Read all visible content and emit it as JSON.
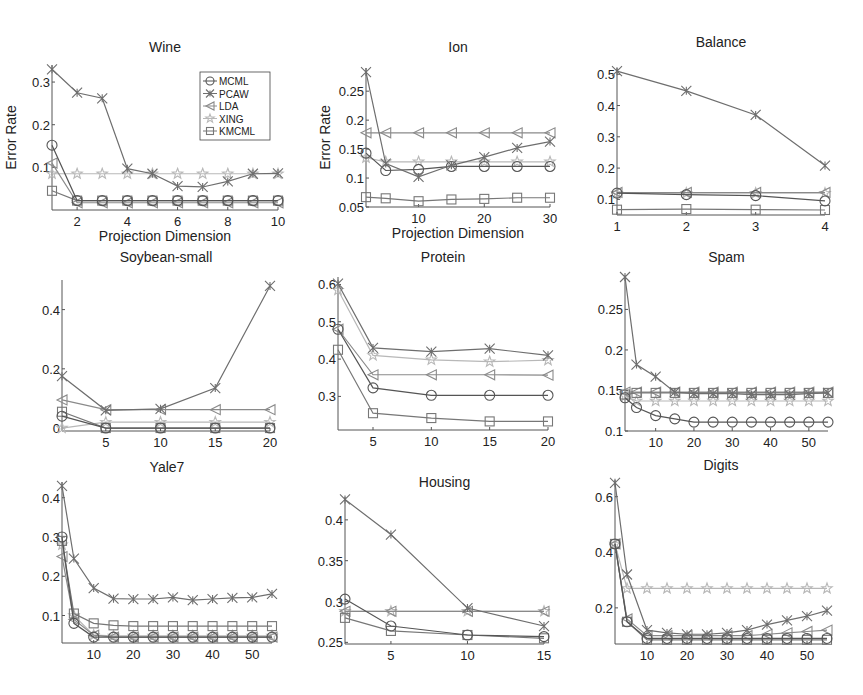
{
  "figure": {
    "legend": {
      "entries": [
        "MCML",
        "PCAW",
        "LDA",
        "XING",
        "KMCML"
      ]
    },
    "series_styles": {
      "MCML": {
        "color": "#555555",
        "marker": "circle"
      },
      "PCAW": {
        "color": "#6e6e6e",
        "marker": "x"
      },
      "LDA": {
        "color": "#8a8a8a",
        "marker": "triangle-left"
      },
      "XING": {
        "color": "#b8b8b8",
        "marker": "star"
      },
      "KMCML": {
        "color": "#777777",
        "marker": "square"
      }
    }
  },
  "chart_data": [
    {
      "type": "line",
      "title": "Wine",
      "xlabel": "Projection Dimension",
      "ylabel": "Error Rate",
      "xlim": [
        1,
        10
      ],
      "ylim": [
        0,
        0.34
      ],
      "xticks": [
        2,
        4,
        6,
        8,
        10
      ],
      "yticks": [
        0.1,
        0.2,
        0.3
      ],
      "ytick_labels": [
        "0.1",
        "0.2",
        "0.3"
      ],
      "legend_position": "upper right",
      "x": [
        1,
        2,
        3,
        4,
        5,
        6,
        7,
        8,
        9,
        10
      ],
      "series": [
        {
          "name": "MCML",
          "values": [
            0.152,
            0.022,
            0.022,
            0.022,
            0.022,
            0.022,
            0.022,
            0.022,
            0.022,
            0.022
          ]
        },
        {
          "name": "PCAW",
          "values": [
            0.33,
            0.275,
            0.262,
            0.097,
            0.085,
            0.056,
            0.054,
            0.067,
            0.085,
            0.086
          ]
        },
        {
          "name": "LDA",
          "values": [
            0.11,
            0.017,
            0.017,
            0.017,
            0.017,
            0.017,
            0.017,
            0.017,
            0.017,
            0.017
          ]
        },
        {
          "name": "XING",
          "values": [
            0.085,
            0.085,
            0.085,
            0.085,
            0.085,
            0.085,
            0.085,
            0.085,
            0.085,
            0.085
          ]
        },
        {
          "name": "KMCML",
          "values": [
            0.045,
            0.022,
            0.022,
            0.022,
            0.022,
            0.022,
            0.022,
            0.022,
            0.022,
            0.022
          ]
        }
      ]
    },
    {
      "type": "line",
      "title": "Ion",
      "xlabel": "Projection Dimension",
      "ylabel": "Error Rate",
      "xlim": [
        2,
        30
      ],
      "ylim": [
        0.05,
        0.29
      ],
      "xticks": [
        10,
        20,
        30
      ],
      "yticks": [
        0.05,
        0.1,
        0.15,
        0.2,
        0.25
      ],
      "ytick_labels": [
        "0.05",
        "0.1",
        "0.15",
        "0.2",
        "0.25"
      ],
      "x": [
        2,
        5,
        10,
        15,
        20,
        25,
        30
      ],
      "series": [
        {
          "name": "MCML",
          "values": [
            0.143,
            0.113,
            0.115,
            0.12,
            0.12,
            0.12,
            0.12
          ]
        },
        {
          "name": "PCAW",
          "values": [
            0.283,
            0.125,
            0.102,
            0.122,
            0.136,
            0.152,
            0.163
          ]
        },
        {
          "name": "LDA",
          "values": [
            0.178,
            0.178,
            0.178,
            0.178,
            0.178,
            0.178,
            0.178
          ]
        },
        {
          "name": "XING",
          "values": [
            0.135,
            0.128,
            0.128,
            0.128,
            0.128,
            0.128,
            0.128
          ]
        },
        {
          "name": "KMCML",
          "values": [
            0.067,
            0.065,
            0.06,
            0.063,
            0.064,
            0.066,
            0.066
          ]
        }
      ]
    },
    {
      "type": "line",
      "title": "Balance",
      "xlabel": "",
      "ylabel": "",
      "xlim": [
        1,
        4
      ],
      "ylim": [
        0.05,
        0.52
      ],
      "xticks": [
        1,
        2,
        3,
        4
      ],
      "yticks": [
        0.1,
        0.2,
        0.3,
        0.4,
        0.5
      ],
      "ytick_labels": [
        "0.1",
        "0.2",
        "0.3",
        "0.4",
        "0.5"
      ],
      "x": [
        1,
        2,
        3,
        4
      ],
      "series": [
        {
          "name": "MCML",
          "values": [
            0.12,
            0.115,
            0.112,
            0.095
          ]
        },
        {
          "name": "PCAW",
          "values": [
            0.51,
            0.447,
            0.37,
            0.208
          ]
        },
        {
          "name": "LDA",
          "values": [
            0.122,
            0.122,
            0.122,
            0.122
          ]
        },
        {
          "name": "XING",
          "values": [
            0.12,
            0.12,
            0.12,
            0.12
          ]
        },
        {
          "name": "KMCML",
          "values": [
            0.067,
            0.069,
            0.067,
            0.066
          ]
        }
      ]
    },
    {
      "type": "line",
      "title": "Soybean-small",
      "xlabel": "",
      "ylabel": "",
      "xlim": [
        1,
        20
      ],
      "ylim": [
        -0.01,
        0.5
      ],
      "xticks": [
        5,
        10,
        15,
        20
      ],
      "yticks": [
        0,
        0.2,
        0.4
      ],
      "ytick_labels": [
        "0",
        "0.2",
        "0.4"
      ],
      "x": [
        1,
        5,
        10,
        15,
        20
      ],
      "series": [
        {
          "name": "MCML",
          "values": [
            0.04,
            0.0,
            0.0,
            0.0,
            0.0
          ]
        },
        {
          "name": "PCAW",
          "values": [
            0.175,
            0.06,
            0.065,
            0.135,
            0.48
          ]
        },
        {
          "name": "LDA",
          "values": [
            0.095,
            0.062,
            0.062,
            0.062,
            0.062
          ]
        },
        {
          "name": "XING",
          "values": [
            0.0,
            0.02,
            0.02,
            0.02,
            0.02
          ]
        },
        {
          "name": "KMCML",
          "values": [
            0.055,
            0.0,
            0.0,
            0.0,
            0.0
          ]
        }
      ]
    },
    {
      "type": "line",
      "title": "Protein",
      "xlabel": "",
      "ylabel": "",
      "xlim": [
        2,
        20
      ],
      "ylim": [
        0.21,
        0.62
      ],
      "xticks": [
        5,
        10,
        15,
        20
      ],
      "yticks": [
        0.3,
        0.4,
        0.5,
        0.6
      ],
      "ytick_labels": [
        "0.3",
        "0.4",
        "0.5",
        "0.6"
      ],
      "x": [
        2,
        5,
        10,
        15,
        20
      ],
      "series": [
        {
          "name": "MCML",
          "values": [
            0.48,
            0.323,
            0.303,
            0.303,
            0.303
          ]
        },
        {
          "name": "PCAW",
          "values": [
            0.602,
            0.43,
            0.42,
            0.428,
            0.41
          ]
        },
        {
          "name": "LDA",
          "values": [
            0.48,
            0.358,
            0.358,
            0.358,
            0.357
          ]
        },
        {
          "name": "XING",
          "values": [
            0.585,
            0.41,
            0.398,
            0.393,
            0.397
          ]
        },
        {
          "name": "KMCML",
          "values": [
            0.425,
            0.255,
            0.242,
            0.233,
            0.233
          ]
        }
      ]
    },
    {
      "type": "line",
      "title": "Spam",
      "xlabel": "",
      "ylabel": "",
      "xlim": [
        2,
        55
      ],
      "ylim": [
        0.1,
        0.29
      ],
      "xticks": [
        10,
        20,
        30,
        40,
        50
      ],
      "yticks": [
        0.1,
        0.15,
        0.2,
        0.25
      ],
      "ytick_labels": [
        "0.1",
        "0.15",
        "0.2",
        "0.25"
      ],
      "x": [
        2,
        5,
        10,
        15,
        20,
        25,
        30,
        35,
        40,
        45,
        50,
        55
      ],
      "series": [
        {
          "name": "MCML",
          "values": [
            0.141,
            0.129,
            0.119,
            0.115,
            0.111,
            0.111,
            0.111,
            0.111,
            0.111,
            0.111,
            0.111,
            0.111
          ]
        },
        {
          "name": "PCAW",
          "values": [
            0.29,
            0.182,
            0.167,
            0.148,
            0.146,
            0.146,
            0.146,
            0.145,
            0.145,
            0.145,
            0.146,
            0.147
          ]
        },
        {
          "name": "LDA",
          "values": [
            0.148,
            0.148,
            0.148,
            0.148,
            0.148,
            0.148,
            0.148,
            0.148,
            0.148,
            0.148,
            0.148,
            0.148
          ]
        },
        {
          "name": "XING",
          "values": [
            0.143,
            0.137,
            0.137,
            0.137,
            0.137,
            0.137,
            0.137,
            0.137,
            0.137,
            0.137,
            0.137,
            0.137
          ]
        },
        {
          "name": "KMCML",
          "values": [
            0.145,
            0.147,
            0.147,
            0.147,
            0.147,
            0.147,
            0.147,
            0.147,
            0.147,
            0.147,
            0.147,
            0.147
          ]
        }
      ]
    },
    {
      "type": "line",
      "title": "Yale7",
      "xlabel": "",
      "ylabel": "",
      "xlim": [
        2,
        55
      ],
      "ylim": [
        0.03,
        0.44
      ],
      "xticks": [
        10,
        20,
        30,
        40,
        50
      ],
      "yticks": [
        0.1,
        0.2,
        0.3,
        0.4
      ],
      "ytick_labels": [
        "0.1",
        "0.2",
        "0.3",
        "0.4"
      ],
      "x": [
        2,
        5,
        10,
        15,
        20,
        25,
        30,
        35,
        40,
        45,
        50,
        55
      ],
      "series": [
        {
          "name": "MCML",
          "values": [
            0.3,
            0.08,
            0.045,
            0.045,
            0.045,
            0.045,
            0.045,
            0.045,
            0.045,
            0.045,
            0.045,
            0.045
          ]
        },
        {
          "name": "PCAW",
          "values": [
            0.43,
            0.245,
            0.17,
            0.143,
            0.142,
            0.142,
            0.146,
            0.139,
            0.142,
            0.145,
            0.146,
            0.155
          ]
        },
        {
          "name": "LDA",
          "values": [
            0.25,
            0.09,
            0.05,
            0.045,
            0.045,
            0.045,
            0.045,
            0.045,
            0.045,
            0.045,
            0.045,
            0.045
          ]
        },
        {
          "name": "XING",
          "values": [
            0.28,
            0.1,
            0.05,
            0.048,
            0.048,
            0.048,
            0.048,
            0.048,
            0.048,
            0.048,
            0.048,
            0.048
          ]
        },
        {
          "name": "KMCML",
          "values": [
            0.29,
            0.105,
            0.08,
            0.075,
            0.073,
            0.073,
            0.073,
            0.073,
            0.073,
            0.073,
            0.073,
            0.073
          ]
        }
      ]
    },
    {
      "type": "line",
      "title": "Housing",
      "xlabel": "",
      "ylabel": "",
      "xlim": [
        2,
        15
      ],
      "ylim": [
        0.248,
        0.428
      ],
      "xticks": [
        5,
        10,
        15
      ],
      "yticks": [
        0.25,
        0.3,
        0.35,
        0.4
      ],
      "ytick_labels": [
        "0.25",
        "0.3",
        "0.35",
        "0.4"
      ],
      "x": [
        2,
        5,
        10,
        15
      ],
      "series": [
        {
          "name": "MCML",
          "values": [
            0.303,
            0.27,
            0.259,
            0.257
          ]
        },
        {
          "name": "PCAW",
          "values": [
            0.425,
            0.382,
            0.292,
            0.27
          ]
        },
        {
          "name": "LDA",
          "values": [
            0.288,
            0.288,
            0.288,
            0.288
          ]
        },
        {
          "name": "XING",
          "values": [
            0.288,
            0.288,
            0.288,
            0.288
          ]
        },
        {
          "name": "KMCML",
          "values": [
            0.28,
            0.264,
            0.259,
            0.255
          ]
        }
      ]
    },
    {
      "type": "line",
      "title": "Digits",
      "xlabel": "",
      "ylabel": "",
      "xlim": [
        2,
        55
      ],
      "ylim": [
        0.07,
        0.66
      ],
      "xticks": [
        10,
        20,
        30,
        40,
        50
      ],
      "yticks": [
        0.2,
        0.4,
        0.6
      ],
      "ytick_labels": [
        "0.2",
        "0.4",
        "0.6"
      ],
      "x": [
        2,
        5,
        10,
        15,
        20,
        25,
        30,
        35,
        40,
        45,
        50,
        55
      ],
      "series": [
        {
          "name": "MCML",
          "values": [
            0.43,
            0.15,
            0.09,
            0.09,
            0.09,
            0.09,
            0.09,
            0.09,
            0.09,
            0.09,
            0.09,
            0.09
          ]
        },
        {
          "name": "PCAW",
          "values": [
            0.65,
            0.32,
            0.12,
            0.11,
            0.105,
            0.105,
            0.11,
            0.12,
            0.14,
            0.155,
            0.17,
            0.19
          ]
        },
        {
          "name": "LDA",
          "values": [
            0.43,
            0.16,
            0.1,
            0.1,
            0.1,
            0.1,
            0.1,
            0.1,
            0.105,
            0.11,
            0.115,
            0.12
          ]
        },
        {
          "name": "XING",
          "values": [
            0.43,
            0.27,
            0.27,
            0.27,
            0.27,
            0.27,
            0.27,
            0.27,
            0.27,
            0.27,
            0.27,
            0.27
          ]
        },
        {
          "name": "KMCML",
          "values": [
            0.43,
            0.15,
            0.085,
            0.085,
            0.085,
            0.085,
            0.085,
            0.085,
            0.085,
            0.085,
            0.085,
            0.085
          ]
        }
      ]
    }
  ]
}
